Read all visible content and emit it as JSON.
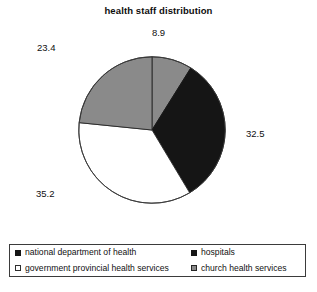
{
  "chart_data": {
    "type": "pie",
    "title": "health staff distribution",
    "xlabel": "",
    "ylabel": "",
    "legend_position": "bottom",
    "grid": false,
    "start_angle_deg": 0,
    "direction": "clockwise",
    "categories": [
      "hospitals",
      "national department of health",
      "government provincial health services",
      "church health services"
    ],
    "values": [
      8.9,
      32.5,
      35.2,
      23.4
    ],
    "slices": [
      {
        "label": "8.9",
        "value": 8.9,
        "category": "hospitals",
        "color": "#8a8a8a",
        "edge": "#262626"
      },
      {
        "label": "32.5",
        "value": 32.5,
        "category": "national department of health",
        "color": "#151515",
        "edge": "#151515"
      },
      {
        "label": "35.2",
        "value": 35.2,
        "category": "government provincial health services",
        "color": "#ffffff",
        "edge": "#2e2e2e"
      },
      {
        "label": "23.4",
        "value": 23.4,
        "category": "church health services",
        "color": "#8a8a8a",
        "edge": "#262626"
      }
    ]
  },
  "legend": {
    "items": [
      {
        "label": "national department of health",
        "swatch": "#151515",
        "swatch_border": "#151515"
      },
      {
        "label": "hospitals",
        "swatch": "#151515",
        "swatch_border": "#151515"
      },
      {
        "label": "government provincial health services",
        "swatch": "#ffffff",
        "swatch_border": "#2e2e2e"
      },
      {
        "label": "church health services",
        "swatch": "#8a8a8a",
        "swatch_border": "#262626"
      }
    ]
  }
}
